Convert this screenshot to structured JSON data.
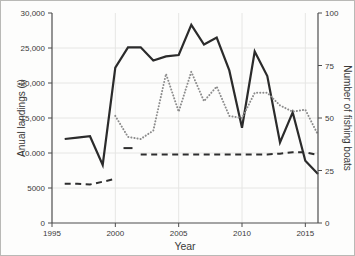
{
  "figure": {
    "background": "#fdfdfc",
    "border_color": "#b9b9b6"
  },
  "chart_data": {
    "type": "line",
    "title": "",
    "xlabel": "Year",
    "ylabel_left": "Anual landings (t)",
    "ylabel_right": "Number of fishing boats",
    "grid": true,
    "grid_color": "#e6e6e4",
    "spine_color": "#4d4d4d",
    "text_color": "#3a3a3a",
    "x_range": [
      1995,
      2016
    ],
    "x_ticks": [
      1995,
      2000,
      2005,
      2010,
      2015
    ],
    "x_tick_labels": [
      "1995",
      "2000",
      "2005",
      "2010",
      "2015"
    ],
    "y_left": {
      "range": [
        0,
        30000
      ],
      "ticks": [
        0,
        5000,
        10000,
        15000,
        20000,
        25000,
        30000
      ],
      "tick_labels": [
        "0",
        "5000",
        "10.000",
        "15,000",
        "20,000",
        "25,000",
        "30,000"
      ]
    },
    "y_right": {
      "range": [
        0,
        100
      ],
      "ticks": [
        0,
        25,
        50,
        75,
        100
      ],
      "tick_labels": [
        "0",
        "25",
        "50",
        "75",
        "100"
      ]
    },
    "series": [
      {
        "name": "annual-landings",
        "axis": "left",
        "style": "solid",
        "color": "#2b2b2b",
        "width": 2.2,
        "segments": [
          {
            "x": [
              1996,
              1997,
              1998,
              1999,
              2000,
              2001,
              2002,
              2003,
              2004,
              2005,
              2006,
              2007,
              2008,
              2009,
              2010,
              2011,
              2012,
              2013,
              2014,
              2015,
              2016
            ],
            "values": [
              12000,
              12200,
              12400,
              8300,
              22200,
              25100,
              25100,
              23200,
              23800,
              24000,
              28300,
              25500,
              26500,
              21800,
              13600,
              24500,
              21000,
              11500,
              15800,
              8900,
              7000
            ]
          }
        ]
      },
      {
        "name": "number-of-fishing-boats",
        "axis": "right",
        "style": "dotted",
        "color": "#8c8c8c",
        "width": 2,
        "segments": [
          {
            "x": [
              2000,
              2001,
              2002,
              2003,
              2004,
              2005,
              2006,
              2007,
              2008,
              2009,
              2010,
              2011,
              2012,
              2013,
              2014,
              2015,
              2016
            ],
            "values": [
              51,
              41,
              40,
              44,
              71,
              53,
              72,
              58,
              65,
              51,
              50,
              62,
              62,
              56,
              53,
              54,
              42
            ]
          }
        ]
      },
      {
        "name": "dashed-unlabeled-series",
        "axis": "left",
        "style": "dashed",
        "color": "#2e2e2e",
        "width": 2,
        "segments": [
          {
            "x": [
              1996,
              1997,
              1998,
              1999,
              2000
            ],
            "values": [
              5600,
              5600,
              5500,
              5900,
              6300
            ]
          },
          {
            "x": [
              2001
            ],
            "values": [
              10700
            ]
          },
          {
            "x": [
              2002,
              2003,
              2004,
              2005,
              2006,
              2007,
              2008,
              2009,
              2010,
              2011,
              2012,
              2013,
              2014,
              2015,
              2016
            ],
            "values": [
              9800,
              9800,
              9800,
              9800,
              9800,
              9800,
              9800,
              9800,
              9800,
              9800,
              9800,
              9900,
              10100,
              10100,
              9700
            ]
          }
        ]
      }
    ]
  }
}
